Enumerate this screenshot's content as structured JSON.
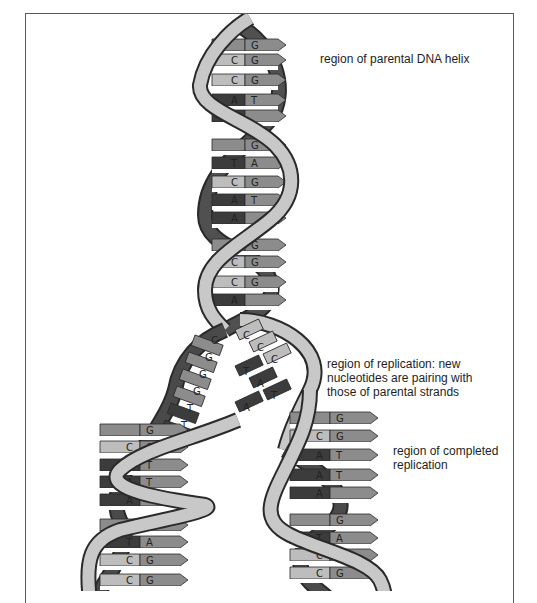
{
  "diagram": {
    "labels": {
      "parental": "region of parental DNA helix",
      "replication": "region of replication: new\nnucleotides are pairing with\nthose of parental strands",
      "completed": "region of completed\nreplication"
    },
    "colors": {
      "backbone_light": "#c8c8c8",
      "backbone_dark": "#4a4a4a",
      "base_dark": "#3c3c3c",
      "base_mid": "#8c8c8c",
      "base_light": "#bdbdbd",
      "outline": "#2a2a2a",
      "frame": "#5a5a5a"
    },
    "parental_pairs": [
      {
        "left": "",
        "right": "G",
        "y": 45
      },
      {
        "left": "C",
        "right": "G",
        "y": 60
      },
      {
        "left": "C",
        "right": "G",
        "y": 80
      },
      {
        "left": "A",
        "right": "T",
        "y": 100
      },
      {
        "left": "A",
        "right": "",
        "y": 116
      },
      {
        "left": "",
        "right": "G",
        "y": 145
      },
      {
        "left": "T",
        "right": "A",
        "y": 163
      },
      {
        "left": "C",
        "right": "G",
        "y": 182
      },
      {
        "left": "A",
        "right": "T",
        "y": 200
      },
      {
        "left": "A",
        "right": "",
        "y": 218
      },
      {
        "left": "",
        "right": "G",
        "y": 245
      },
      {
        "left": "C",
        "right": "G",
        "y": 262
      },
      {
        "left": "C",
        "right": "G",
        "y": 282
      },
      {
        "left": "A",
        "right": "",
        "y": 300
      }
    ],
    "fork_left_bases": [
      "C",
      "G",
      "G",
      "G",
      "T",
      "T"
    ],
    "fork_right_bases": [
      "C",
      "C",
      "C",
      "T",
      "A",
      "T",
      "A"
    ],
    "left_daughter_pairs": [
      {
        "left": "",
        "right": "G",
        "y": 430
      },
      {
        "left": "C",
        "right": "G",
        "y": 447
      },
      {
        "left": "A",
        "right": "T",
        "y": 465
      },
      {
        "left": "A",
        "right": "T",
        "y": 482
      },
      {
        "left": "A",
        "right": "",
        "y": 500
      },
      {
        "left": "",
        "right": "G",
        "y": 525
      },
      {
        "left": "T",
        "right": "A",
        "y": 542
      },
      {
        "left": "C",
        "right": "G",
        "y": 560
      },
      {
        "left": "C",
        "right": "G",
        "y": 580
      }
    ],
    "right_daughter_pairs": [
      {
        "left": "",
        "right": "G",
        "y": 418
      },
      {
        "left": "C",
        "right": "G",
        "y": 436
      },
      {
        "left": "A",
        "right": "T",
        "y": 455
      },
      {
        "left": "A",
        "right": "T",
        "y": 475
      },
      {
        "left": "A",
        "right": "",
        "y": 493
      },
      {
        "left": "",
        "right": "G",
        "y": 520
      },
      {
        "left": "T",
        "right": "A",
        "y": 538
      },
      {
        "left": "C",
        "right": "G",
        "y": 555
      },
      {
        "left": "C",
        "right": "G",
        "y": 573
      }
    ]
  }
}
